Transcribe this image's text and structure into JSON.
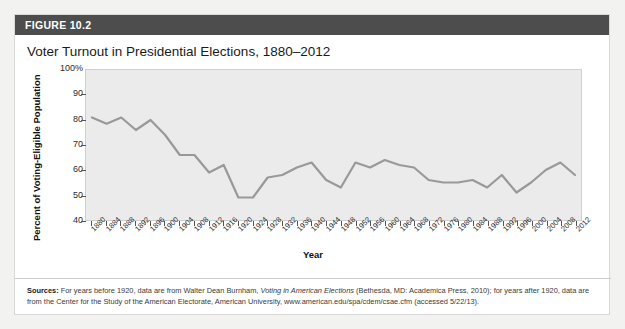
{
  "figure": {
    "header_label": "FIGURE 10.2",
    "title": "Voter Turnout in Presidential Elections, 1880–2012",
    "header_bg": "#4d4d4d",
    "plot_bg": "#ebebeb",
    "line_color": "#999999"
  },
  "sources": {
    "label": "Sources:",
    "part1": " For years before 1920, data are from Walter Dean Burnham, ",
    "italic1": "Voting in American Elections",
    "part2": " (Bethesda, MD: Academica Press, 2010); for years after 1920, data are from the Center for the Study of the American Electorate, American University, www.american.edu/spa/cdem/csae.cfm (accessed 5/22/13)."
  },
  "chart_data": {
    "type": "line",
    "title": "Voter Turnout in Presidential Elections, 1880–2012",
    "xlabel": "Year",
    "ylabel": "Percent of Voting-Eligible Population",
    "ylim": [
      40,
      100
    ],
    "yticks": [
      40,
      50,
      60,
      70,
      80,
      90,
      100
    ],
    "ytick_labels": [
      "40",
      "50",
      "60",
      "70",
      "80",
      "90",
      "100%"
    ],
    "grid": false,
    "legend": "none",
    "categories": [
      "1880",
      "1884",
      "1888",
      "1892",
      "1896",
      "1900",
      "1904",
      "1908",
      "1912",
      "1916",
      "1920",
      "1924",
      "1928",
      "1932",
      "1936",
      "1940",
      "1944",
      "1948",
      "1952",
      "1956",
      "1960",
      "1964",
      "1968",
      "1972",
      "1976",
      "1980",
      "1984",
      "1988",
      "1992",
      "1996",
      "2000",
      "2004",
      "2008",
      "2012"
    ],
    "values": [
      81,
      78.5,
      81,
      76,
      80,
      74,
      66,
      66,
      59,
      62,
      49,
      49,
      57,
      58,
      61,
      63,
      56,
      53,
      63,
      61,
      64,
      62,
      61,
      56,
      55,
      55,
      56,
      53,
      58,
      51,
      55,
      60,
      63,
      58
    ]
  }
}
